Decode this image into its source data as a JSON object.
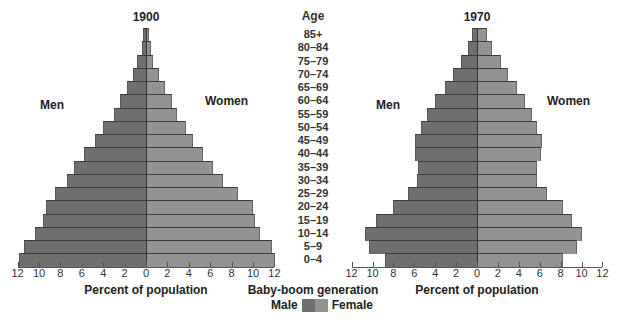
{
  "chart_data": [
    {
      "type": "bar",
      "subtype": "population-pyramid",
      "title": "1900",
      "xlabel": "Percent of population",
      "ylabel": "Age",
      "left_label": "Men",
      "right_label": "Women",
      "xlim": [
        -12,
        12
      ],
      "x_ticks": [
        12,
        10,
        8,
        6,
        4,
        2,
        0,
        2,
        4,
        6,
        8,
        10,
        12
      ],
      "categories": [
        "85+",
        "80-84",
        "75-79",
        "70-74",
        "65-69",
        "60-64",
        "55-59",
        "50-54",
        "45-49",
        "40-44",
        "35-39",
        "30-34",
        "25-29",
        "20-24",
        "15-19",
        "10-14",
        "5-9",
        "0-4"
      ],
      "series": [
        {
          "name": "Male",
          "values": [
            0.3,
            0.4,
            0.8,
            1.2,
            1.8,
            2.4,
            3.0,
            4.0,
            4.8,
            5.8,
            6.7,
            7.4,
            8.5,
            9.3,
            9.6,
            10.4,
            11.4,
            11.9
          ]
        },
        {
          "name": "Female",
          "values": [
            0.3,
            0.5,
            0.7,
            1.2,
            1.8,
            2.4,
            2.9,
            3.7,
            4.4,
            5.3,
            6.3,
            7.2,
            8.6,
            10.0,
            10.2,
            10.7,
            11.8,
            12.1
          ]
        }
      ]
    },
    {
      "type": "bar",
      "subtype": "population-pyramid",
      "title": "1970",
      "xlabel": "Percent of population",
      "ylabel": "Age",
      "left_label": "Men",
      "right_label": "Women",
      "xlim": [
        -12,
        12
      ],
      "x_ticks": [
        12,
        10,
        8,
        6,
        4,
        2,
        0,
        2,
        4,
        6,
        8,
        10,
        12
      ],
      "categories": [
        "85+",
        "80-84",
        "75-79",
        "70-74",
        "65-69",
        "60-64",
        "55-59",
        "50-54",
        "45-49",
        "40-44",
        "35-39",
        "30-34",
        "25-29",
        "20-24",
        "15-19",
        "10-14",
        "5-9",
        "0-4"
      ],
      "series": [
        {
          "name": "Male",
          "values": [
            0.5,
            0.9,
            1.5,
            2.3,
            3.1,
            4.0,
            4.8,
            5.4,
            5.9,
            5.9,
            5.6,
            5.7,
            6.6,
            8.0,
            9.7,
            10.7,
            10.3,
            8.8
          ]
        },
        {
          "name": "Female",
          "values": [
            1.0,
            1.4,
            2.3,
            3.0,
            3.8,
            4.6,
            5.3,
            5.7,
            6.2,
            6.1,
            5.7,
            5.7,
            6.7,
            8.2,
            9.1,
            10.0,
            9.6,
            8.2
          ]
        }
      ],
      "annotation": "Baby-boom generation"
    }
  ],
  "labels": {
    "age_header": "Age",
    "ages": [
      "85+",
      "80–84",
      "75–79",
      "70–74",
      "65–69",
      "60–64",
      "55–59",
      "50–54",
      "45–49",
      "40–44",
      "35–39",
      "30–34",
      "25–29",
      "20–24",
      "15–19",
      "10–14",
      "5–9",
      "0–4"
    ],
    "chart1900": {
      "title": "1900",
      "men": "Men",
      "women": "Women",
      "xlabel": "Percent of population"
    },
    "chart1970": {
      "title": "1970",
      "men": "Men",
      "women": "Women",
      "xlabel": "Percent of population"
    },
    "ticks": [
      "12",
      "10",
      "8",
      "6",
      "4",
      "2",
      "0",
      "2",
      "4",
      "6",
      "8",
      "10",
      "12"
    ]
  },
  "legend": {
    "title": "Baby-boom generation",
    "male": "Male",
    "female": "Female",
    "colors": {
      "male": "#6f6f6f",
      "female": "#939393"
    }
  }
}
